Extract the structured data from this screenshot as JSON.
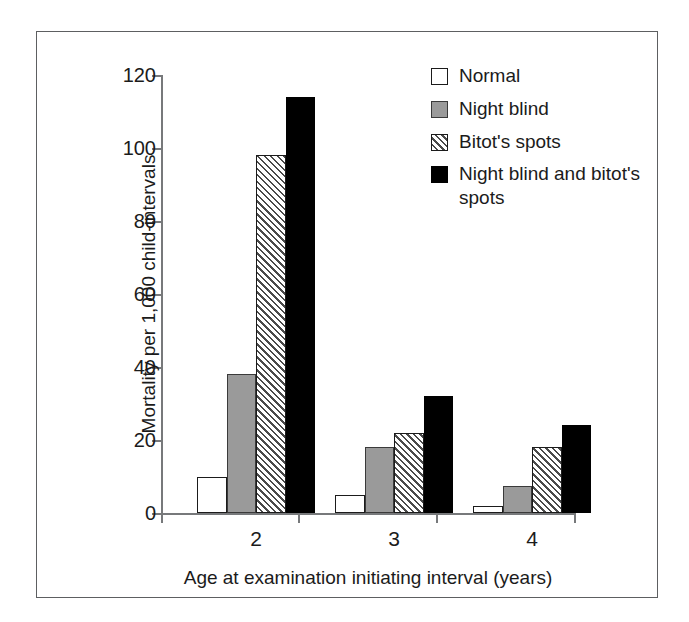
{
  "chart_data": {
    "type": "bar",
    "title": "",
    "xlabel": "Age at examination initiating interval (years)",
    "ylabel": "Mortality per 1,000 child-intervals",
    "categories": [
      "2",
      "3",
      "4"
    ],
    "ylim": [
      0,
      120
    ],
    "yticks": [
      0,
      20,
      40,
      60,
      80,
      100,
      120
    ],
    "ytick_labels": [
      "0",
      "20",
      "40",
      "60",
      "80",
      "100",
      "120"
    ],
    "grid": false,
    "legend_position": "top-right",
    "series": [
      {
        "name": "Normal",
        "style": "white-outline",
        "color": "#ffffff",
        "values": [
          10,
          5,
          2
        ]
      },
      {
        "name": "Night blind",
        "style": "solid-gray",
        "color": "#9a9a9a",
        "values": [
          38,
          18,
          7.5
        ]
      },
      {
        "name": "Bitot's spots",
        "style": "diagonal-hatch",
        "color": "#ffffff",
        "values": [
          98,
          22,
          18
        ]
      },
      {
        "name": "Night blind and bitot's spots",
        "style": "solid-black",
        "color": "#000000",
        "values": [
          114,
          32,
          24
        ]
      }
    ]
  },
  "legend": {
    "entries": [
      {
        "label": "Normal",
        "swatch": "legend-swatch-normal"
      },
      {
        "label": "Night blind",
        "swatch": "legend-swatch-night-blind"
      },
      {
        "label": "Bitot's spots",
        "swatch": "legend-swatch-bitots-spots"
      },
      {
        "label": "Night blind and bitot's spots",
        "swatch": "legend-swatch-night-blind-and-bitots-spots"
      }
    ]
  },
  "axes": {
    "y_title": "Mortality per 1,000 child-intervals",
    "x_title": "Age at examination initiating interval (years)"
  }
}
